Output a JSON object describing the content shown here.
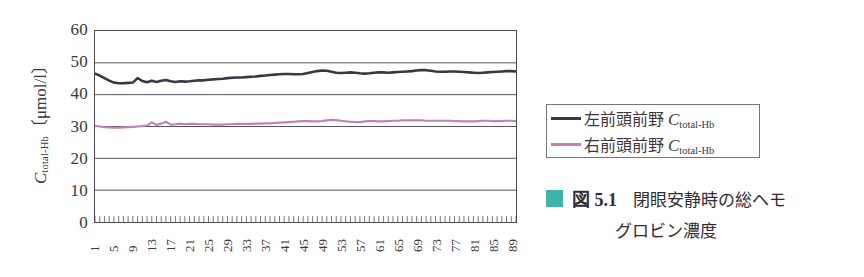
{
  "figure": {
    "caption_marker_color": "#3cb3ab",
    "caption_number": "図 5.1",
    "caption_text_line1": "閉眼安静時の総ヘモ",
    "caption_text_line2": "グロビン濃度"
  },
  "legend": {
    "position": "right",
    "entries": [
      {
        "label_main": "左前頭前野",
        "label_sym": "C",
        "label_sub": "total-Hb",
        "color": "#3a3646"
      },
      {
        "label_main": "右前頭前野",
        "label_sym": "C",
        "label_sub": "total-Hb",
        "color": "#c183b4"
      }
    ]
  },
  "axis": {
    "y_title_sym": "C",
    "y_title_sub": "total-Hb",
    "y_title_unit": "〔μmol/l〕",
    "y_ticks": [
      "60",
      "50",
      "40",
      "30",
      "20",
      "10",
      "0"
    ],
    "x_ticks": [
      "1",
      "5",
      "9",
      "13",
      "17",
      "21",
      "25",
      "29",
      "33",
      "37",
      "41",
      "45",
      "49",
      "53",
      "57",
      "61",
      "65",
      "69",
      "73",
      "77",
      "81",
      "85",
      "89"
    ]
  },
  "chart_data": {
    "type": "line",
    "xlabel": "",
    "ylabel": "C_total-Hb 〔μmol/l〕",
    "ylim": [
      0,
      60
    ],
    "xlim": [
      1,
      90
    ],
    "grid": true,
    "gridlines_y": [
      10,
      20,
      30,
      40,
      50
    ],
    "y_tick_step": 10,
    "x_tick_step": 4,
    "x": [
      1,
      2,
      3,
      4,
      5,
      6,
      7,
      8,
      9,
      10,
      11,
      12,
      13,
      14,
      15,
      16,
      17,
      18,
      19,
      20,
      21,
      22,
      23,
      24,
      25,
      26,
      27,
      28,
      29,
      30,
      31,
      32,
      33,
      34,
      35,
      36,
      37,
      38,
      39,
      40,
      41,
      42,
      43,
      44,
      45,
      46,
      47,
      48,
      49,
      50,
      51,
      52,
      53,
      54,
      55,
      56,
      57,
      58,
      59,
      60,
      61,
      62,
      63,
      64,
      65,
      66,
      67,
      68,
      69,
      70,
      71,
      72,
      73,
      74,
      75,
      76,
      77,
      78,
      79,
      80,
      81,
      82,
      83,
      84,
      85,
      86,
      87,
      88,
      89,
      90
    ],
    "series": [
      {
        "name": "左前頭前野 C_total-Hb",
        "color": "#3a3646",
        "values": [
          46.6,
          46.0,
          45.2,
          44.4,
          43.8,
          43.6,
          43.6,
          43.7,
          43.8,
          45.2,
          44.3,
          43.9,
          44.4,
          44.0,
          44.4,
          44.6,
          44.2,
          44.0,
          44.2,
          44.1,
          44.2,
          44.4,
          44.5,
          44.5,
          44.7,
          44.8,
          44.9,
          45.0,
          45.2,
          45.3,
          45.4,
          45.4,
          45.5,
          45.6,
          45.7,
          45.9,
          46.0,
          46.2,
          46.3,
          46.4,
          46.5,
          46.5,
          46.4,
          46.4,
          46.5,
          46.8,
          47.1,
          47.4,
          47.6,
          47.5,
          47.2,
          46.9,
          46.8,
          46.9,
          47.0,
          46.9,
          46.7,
          46.6,
          46.7,
          46.9,
          47.0,
          47.0,
          46.9,
          47.0,
          47.1,
          47.2,
          47.3,
          47.4,
          47.6,
          47.7,
          47.7,
          47.5,
          47.3,
          47.2,
          47.2,
          47.3,
          47.3,
          47.2,
          47.1,
          47.0,
          46.9,
          46.8,
          46.9,
          47.0,
          47.1,
          47.2,
          47.3,
          47.4,
          47.4,
          47.3
        ]
      },
      {
        "name": "右前頭前野 C_total-Hb",
        "color": "#c183b4",
        "values": [
          30.2,
          30.0,
          29.8,
          29.7,
          29.6,
          29.6,
          29.7,
          29.8,
          29.9,
          30.0,
          30.1,
          30.3,
          31.3,
          30.5,
          30.9,
          31.5,
          30.6,
          30.7,
          30.9,
          30.7,
          30.8,
          30.8,
          30.7,
          30.7,
          30.7,
          30.6,
          30.6,
          30.6,
          30.7,
          30.7,
          30.8,
          30.8,
          30.8,
          30.8,
          30.9,
          30.9,
          31.0,
          31.0,
          31.1,
          31.2,
          31.3,
          31.4,
          31.5,
          31.6,
          31.7,
          31.7,
          31.6,
          31.6,
          31.7,
          31.9,
          32.1,
          32.0,
          31.8,
          31.6,
          31.5,
          31.4,
          31.4,
          31.6,
          31.7,
          31.7,
          31.6,
          31.6,
          31.7,
          31.8,
          31.8,
          31.9,
          31.9,
          31.9,
          31.9,
          31.9,
          31.8,
          31.8,
          31.8,
          31.8,
          31.8,
          31.8,
          31.7,
          31.7,
          31.6,
          31.6,
          31.6,
          31.7,
          31.8,
          31.8,
          31.7,
          31.7,
          31.7,
          31.8,
          31.8,
          31.7
        ]
      }
    ]
  }
}
